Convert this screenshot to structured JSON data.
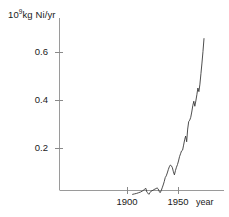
{
  "chart_data": {
    "type": "line",
    "title": "",
    "subtitle": "",
    "xlabel": "year",
    "ylabel": "10⁹kg Ni/yr",
    "ylabel_mantissa": "10",
    "ylabel_exponent": "9",
    "ylabel_rest": "kg Ni/yr",
    "xlim": [
      1903,
      1978
    ],
    "ylim": [
      0,
      0.72
    ],
    "grid": false,
    "legend": null,
    "line_color": "#3a3a3a",
    "axis_color": "#8a8a8a",
    "x_ticks": [
      1900,
      1950
    ],
    "x_tick_labels": [
      "1900",
      "1950"
    ],
    "y_ticks": [
      0.2,
      0.4,
      0.6
    ],
    "y_tick_labels": [
      "0.2",
      "0.4",
      "0.6"
    ],
    "series": [
      {
        "name": "World nickel production",
        "x": [
          1905,
          1907,
          1909,
          1911,
          1913,
          1915,
          1917,
          1918,
          1919,
          1920,
          1921,
          1922,
          1923,
          1924,
          1925,
          1926,
          1927,
          1928,
          1929,
          1930,
          1931,
          1932,
          1933,
          1934,
          1935,
          1936,
          1937,
          1938,
          1939,
          1940,
          1941,
          1942,
          1943,
          1944,
          1945,
          1946,
          1947,
          1948,
          1949,
          1950,
          1951,
          1952,
          1953,
          1954,
          1955,
          1956,
          1957,
          1958,
          1959,
          1960,
          1961,
          1962,
          1963,
          1964,
          1965,
          1966,
          1967,
          1968,
          1969,
          1970,
          1971,
          1972,
          1973,
          1974,
          1975
        ],
        "y": [
          0.009,
          0.011,
          0.013,
          0.016,
          0.019,
          0.024,
          0.031,
          0.034,
          0.018,
          0.014,
          0.009,
          0.016,
          0.022,
          0.024,
          0.026,
          0.029,
          0.031,
          0.033,
          0.036,
          0.032,
          0.022,
          0.016,
          0.024,
          0.036,
          0.048,
          0.062,
          0.079,
          0.086,
          0.098,
          0.112,
          0.124,
          0.131,
          0.128,
          0.12,
          0.103,
          0.09,
          0.108,
          0.122,
          0.133,
          0.148,
          0.166,
          0.178,
          0.19,
          0.193,
          0.214,
          0.236,
          0.252,
          0.228,
          0.281,
          0.312,
          0.318,
          0.33,
          0.352,
          0.378,
          0.397,
          0.376,
          0.398,
          0.424,
          0.452,
          0.437,
          0.468,
          0.512,
          0.556,
          0.604,
          0.658
        ],
        "annotations": [
          {
            "label": "wartime peak",
            "x": 1943,
            "y": 0.131
          },
          {
            "label": "postwar dip",
            "x": 1946,
            "y": 0.09
          },
          {
            "label": "strike dip",
            "x": 1958,
            "y": 0.228
          },
          {
            "label": "peak",
            "x": 1975,
            "y": 0.658
          }
        ]
      }
    ]
  },
  "axes": {
    "y_unit_label": "10⁹kg Ni/yr",
    "x_axis_name": "year"
  }
}
